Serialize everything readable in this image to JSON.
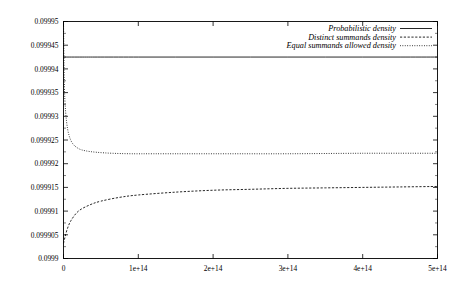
{
  "chart_data": {
    "type": "line",
    "title": "",
    "xlabel": "",
    "ylabel": "",
    "xlim": [
      0,
      500000000000000
    ],
    "ylim": [
      0.0999,
      0.09995
    ],
    "grid": false,
    "legend_position": "top-right",
    "xticks": [
      {
        "value": 0,
        "label": "0"
      },
      {
        "value": 100000000000000,
        "label": "1e+14"
      },
      {
        "value": 200000000000000,
        "label": "2e+14"
      },
      {
        "value": 300000000000000,
        "label": "3e+14"
      },
      {
        "value": 400000000000000,
        "label": "4e+14"
      },
      {
        "value": 500000000000000,
        "label": "5e+14"
      }
    ],
    "yticks": [
      {
        "value": 0.0999,
        "label": "0.0999"
      },
      {
        "value": 0.099905,
        "label": "0.099905"
      },
      {
        "value": 0.09991,
        "label": "0.09991"
      },
      {
        "value": 0.099915,
        "label": "0.099915"
      },
      {
        "value": 0.09992,
        "label": "0.09992"
      },
      {
        "value": 0.099925,
        "label": "0.099925"
      },
      {
        "value": 0.09993,
        "label": "0.09993"
      },
      {
        "value": 0.099935,
        "label": "0.099935"
      },
      {
        "value": 0.09994,
        "label": "0.09994"
      },
      {
        "value": 0.099945,
        "label": "0.099945"
      },
      {
        "value": 0.09995,
        "label": "0.09995"
      }
    ],
    "series": [
      {
        "name": "Probabilistic density",
        "style": "solid",
        "color": "#000000",
        "x": [
          0,
          25000000000000,
          50000000000000,
          100000000000000,
          150000000000000,
          200000000000000,
          250000000000000,
          300000000000000,
          350000000000000,
          400000000000000,
          450000000000000,
          500000000000000
        ],
        "y": [
          0.0999425,
          0.0999425,
          0.0999425,
          0.0999425,
          0.0999425,
          0.0999425,
          0.0999425,
          0.0999425,
          0.0999425,
          0.0999425,
          0.0999425,
          0.0999425
        ]
      },
      {
        "name": "Distinct summands density",
        "style": "dashed",
        "color": "#000000",
        "x": [
          0,
          2000000000000,
          5000000000000,
          10000000000000,
          20000000000000,
          35000000000000,
          50000000000000,
          75000000000000,
          100000000000000,
          150000000000000,
          200000000000000,
          250000000000000,
          300000000000000,
          350000000000000,
          400000000000000,
          450000000000000,
          500000000000000
        ],
        "y": [
          0.0999032,
          0.0999045,
          0.0999062,
          0.099908,
          0.09991,
          0.0999113,
          0.0999121,
          0.0999129,
          0.0999134,
          0.099914,
          0.0999144,
          0.0999146,
          0.0999148,
          0.0999149,
          0.099915,
          0.0999151,
          0.0999152
        ]
      },
      {
        "name": "Equal summands allowed density",
        "style": "dotted",
        "color": "#000000",
        "x": [
          0,
          1000000000000,
          2000000000000,
          4000000000000,
          7000000000000,
          12000000000000,
          20000000000000,
          30000000000000,
          45000000000000,
          65000000000000,
          90000000000000,
          120000000000000,
          160000000000000,
          220000000000000,
          300000000000000,
          400000000000000,
          500000000000000
        ],
        "y": [
          0.09995,
          0.099938,
          0.099933,
          0.099929,
          0.0999262,
          0.0999243,
          0.0999232,
          0.0999227,
          0.0999224,
          0.0999222,
          0.0999221,
          0.0999221,
          0.0999221,
          0.0999221,
          0.0999221,
          0.0999222,
          0.0999222
        ]
      }
    ],
    "legend": [
      {
        "label": "Probabilistic density",
        "style": "solid"
      },
      {
        "label": "Distinct summands density",
        "style": "dashed"
      },
      {
        "label": "Equal summands allowed density",
        "style": "dotted"
      }
    ]
  }
}
